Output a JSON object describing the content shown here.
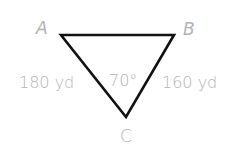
{
  "diagram": {
    "type": "triangle",
    "vertices": [
      {
        "label": "A",
        "x": 61,
        "y": 35
      },
      {
        "label": "B",
        "x": 174,
        "y": 35
      },
      {
        "label": "C",
        "x": 126,
        "y": 117
      }
    ],
    "labels": {
      "vertex_a": "A",
      "vertex_b": "B",
      "vertex_c": "C",
      "side_ac": "180 yd",
      "side_bc": "160 yd",
      "angle_c": "70°"
    },
    "colors": {
      "stroke": "#111111",
      "label": "#b3b3b3",
      "background": "#ffffff"
    }
  }
}
